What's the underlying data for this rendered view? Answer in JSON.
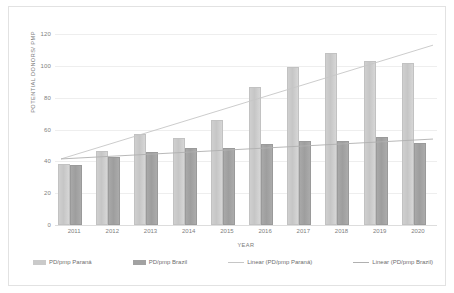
{
  "chart_data": {
    "type": "bar",
    "title": "",
    "xlabel": "YEAR",
    "ylabel": "POTENTIAL DONORS/ PMP",
    "categories": [
      "2011",
      "2012",
      "2013",
      "2014",
      "2015",
      "2016",
      "2017",
      "2018",
      "2019",
      "2020"
    ],
    "ylim": [
      0,
      120
    ],
    "yticks": [
      0,
      20,
      40,
      60,
      80,
      100,
      120
    ],
    "grid": true,
    "legend_position": "bottom",
    "series": [
      {
        "name": "PD/pmp Paraná",
        "type": "bar",
        "color": "#cacaca",
        "values": [
          38.5,
          46.5,
          57,
          54.5,
          66,
          86.5,
          99.5,
          108,
          103,
          101.5
        ]
      },
      {
        "name": "PD/pmp Brazil",
        "type": "bar",
        "color": "#a2a2a2",
        "values": [
          38,
          42.5,
          46,
          48.5,
          48.5,
          51,
          52.5,
          53,
          55,
          51.5
        ]
      },
      {
        "name": "Linear (PD/pmp Paraná)",
        "type": "trendline",
        "color": "#c6c6c6",
        "endpoints": [
          41.5,
          113
        ]
      },
      {
        "name": "Linear (PD/pmp Brazil)",
        "type": "trendline",
        "color": "#b0b0b0",
        "endpoints": [
          41.5,
          54
        ]
      }
    ]
  },
  "legend": {
    "items": [
      {
        "label": "PD/pmp Paraná",
        "marker": "bar",
        "color": "#cacaca"
      },
      {
        "label": "PD/pmp Brazil",
        "marker": "bar",
        "color": "#a2a2a2"
      },
      {
        "label": "Linear (PD/pmp Paraná)",
        "marker": "line",
        "color": "#c6c6c6"
      },
      {
        "label": "Linear (PD/pmp Brazil)",
        "marker": "line",
        "color": "#b0b0b0"
      }
    ]
  }
}
